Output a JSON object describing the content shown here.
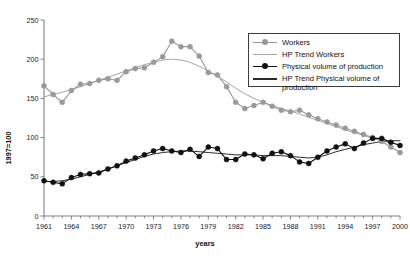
{
  "chart_data": {
    "type": "line",
    "title": "",
    "xlabel": "years",
    "ylabel": "1997=100",
    "xlim": [
      1961,
      2000
    ],
    "ylim": [
      0,
      250
    ],
    "ytick_values": [
      0,
      50,
      100,
      150,
      200,
      250
    ],
    "ytick_labels": [
      "0",
      "50",
      "100",
      "150",
      "200",
      "250"
    ],
    "xtick_labels": [
      "1961",
      "1964",
      "1967",
      "1970",
      "1973",
      "1976",
      "1979",
      "1982",
      "1985",
      "1988",
      "1991",
      "1994",
      "1997",
      "2000"
    ],
    "xtick_values": [
      1961,
      1964,
      1967,
      1970,
      1973,
      1976,
      1979,
      1982,
      1985,
      1988,
      1991,
      1994,
      1997,
      2000
    ],
    "x_minor_step": 1,
    "grid": false,
    "legend_position": "upper-right",
    "x": [
      1961,
      1962,
      1963,
      1964,
      1965,
      1966,
      1967,
      1968,
      1969,
      1970,
      1971,
      1972,
      1973,
      1974,
      1975,
      1976,
      1977,
      1978,
      1979,
      1980,
      1981,
      1982,
      1983,
      1984,
      1985,
      1986,
      1987,
      1988,
      1989,
      1990,
      1991,
      1992,
      1993,
      1994,
      1995,
      1996,
      1997,
      1998,
      1999,
      2000
    ],
    "series": [
      {
        "name": "Workers",
        "style": "line-marker",
        "color": "#999999",
        "marker": "circle",
        "values": [
          166,
          155,
          145,
          160,
          168,
          169,
          173,
          175,
          173,
          184,
          188,
          189,
          196,
          203,
          223,
          216,
          216,
          204,
          183,
          180,
          165,
          145,
          137,
          141,
          145,
          140,
          135,
          133,
          135,
          129,
          124,
          120,
          116,
          112,
          108,
          104,
          100,
          95,
          88,
          81
        ]
      },
      {
        "name": "HP Trend Workers",
        "style": "line",
        "color": "#a6a6a6",
        "marker": "none",
        "values": [
          152,
          155,
          158,
          161,
          165,
          169,
          173,
          177,
          181,
          185,
          189,
          193,
          196,
          199,
          200,
          199,
          196,
          191,
          185,
          178,
          171,
          163,
          156,
          150,
          145,
          141,
          137,
          134,
          130,
          126,
          122,
          118,
          114,
          110,
          106,
          103,
          99,
          96,
          93,
          91
        ]
      },
      {
        "name": "Physical volume of production",
        "style": "line-marker",
        "color": "#111111",
        "marker": "circle",
        "values": [
          45,
          43,
          41,
          49,
          53,
          54,
          55,
          60,
          64,
          70,
          74,
          78,
          83,
          86,
          83,
          81,
          85,
          76,
          88,
          86,
          72,
          72,
          79,
          78,
          73,
          80,
          82,
          77,
          69,
          67,
          75,
          83,
          88,
          92,
          86,
          93,
          99,
          99,
          94,
          90
        ]
      },
      {
        "name": "HP Trend Physical volume of production",
        "style": "line",
        "color": "#2b2b2b",
        "marker": "none",
        "values": [
          44,
          44,
          45,
          47,
          50,
          53,
          56,
          60,
          64,
          68,
          72,
          76,
          79,
          81,
          82,
          83,
          83,
          82,
          81,
          80,
          79,
          78,
          78,
          78,
          77,
          77,
          77,
          76,
          75,
          74,
          75,
          78,
          82,
          85,
          88,
          91,
          93,
          95,
          96,
          96
        ]
      }
    ]
  },
  "legend": {
    "items": [
      {
        "label": "Workers",
        "key": "gray-circle-line"
      },
      {
        "label": "HP Trend Workers",
        "key": "gray-line"
      },
      {
        "label": "Physical volume of production",
        "key": "black-circle-line"
      },
      {
        "label": "HP Trend Physical volume of\nproduction",
        "key": "dark-line"
      }
    ]
  },
  "colors": {
    "workers": "#999999",
    "workers_trend": "#a6a6a6",
    "production": "#111111",
    "production_trend": "#2b2b2b",
    "axis": "#808080",
    "text": "#111111"
  }
}
